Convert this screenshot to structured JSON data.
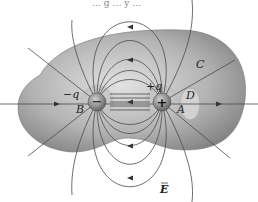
{
  "figure": {
    "title_fragment": "… g … y …",
    "charges": [
      {
        "id": "negative",
        "label": "−q",
        "sign": "−",
        "point_label": "B"
      },
      {
        "id": "positive",
        "label": "+q",
        "sign": "+",
        "point_label": "A"
      }
    ],
    "surface_labels": {
      "large": "C",
      "small": "D"
    },
    "field_label": "E",
    "colors": {
      "surface_fill": "#8e8e8e",
      "surface_light": "#d8d8d8",
      "field_line": "#4a4a4a",
      "charge_sphere": "#7a7a7a",
      "text": "#222222"
    }
  }
}
